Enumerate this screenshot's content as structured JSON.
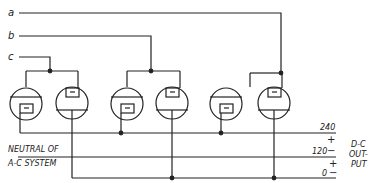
{
  "diagram": {
    "phases": [
      {
        "label": "a"
      },
      {
        "label": "b"
      },
      {
        "label": "c"
      }
    ],
    "neutral_label_line1": "NEUTRAL OF",
    "neutral_label_line2": "A-C SYSTEM",
    "output": {
      "label_line1": "D-C",
      "label_line2": "OUT-",
      "label_line3": "PUT",
      "voltage_top": "240",
      "voltage_mid": "120",
      "voltage_bottom": "0",
      "plus_1": "+",
      "minus_1": "−",
      "plus_2": "+",
      "minus_2": "−"
    },
    "tubes": [
      {
        "id": "tube-1",
        "type": "cathode-down"
      },
      {
        "id": "tube-2",
        "type": "anode-down"
      },
      {
        "id": "tube-3",
        "type": "cathode-down"
      },
      {
        "id": "tube-4",
        "type": "anode-down"
      },
      {
        "id": "tube-5",
        "type": "cathode-down"
      },
      {
        "id": "tube-6",
        "type": "anode-down"
      }
    ],
    "colors": {
      "ink": "#222222",
      "paper": "#ffffff"
    }
  }
}
